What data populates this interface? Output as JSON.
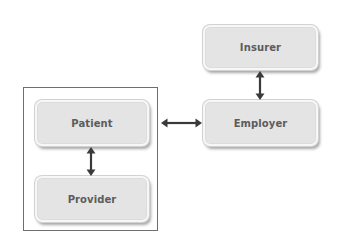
{
  "diagram": {
    "type": "relationship-diagram",
    "nodes": [
      {
        "id": "insurer",
        "label": "Insurer"
      },
      {
        "id": "employer",
        "label": "Employer"
      },
      {
        "id": "patient",
        "label": "Patient"
      },
      {
        "id": "provider",
        "label": "Provider"
      }
    ],
    "groups": [
      {
        "id": "patient-provider-group",
        "members": [
          "patient",
          "provider"
        ]
      }
    ],
    "edges": [
      {
        "from": "insurer",
        "to": "employer",
        "direction": "bidirectional"
      },
      {
        "from": "patient",
        "to": "employer",
        "direction": "bidirectional"
      },
      {
        "from": "patient",
        "to": "provider",
        "direction": "bidirectional"
      }
    ],
    "colors": {
      "node_fill": "#e4e4e4",
      "node_border": "#f7f7f7",
      "label_text": "#5c5c5c",
      "arrow": "#3a3a3a",
      "frame": "#6e6e6e"
    }
  }
}
